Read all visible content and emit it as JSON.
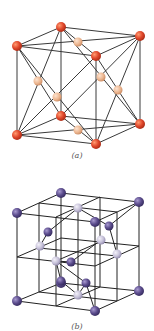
{
  "figures": [
    {
      "id": "a",
      "caption": "(a)",
      "description": "Face-centered cubic unit cell",
      "colors": {
        "corner_atom": "#d9432a",
        "face_atom": "#eab38e",
        "edge": "#333333"
      }
    },
    {
      "id": "b",
      "caption": "(b)",
      "description": "Diamond cubic unit cell",
      "colors": {
        "corner_atom": "#5a4b8a",
        "face_atom": "#c9c4d9",
        "interior_atom": "#5a4b8a",
        "edge": "#222222"
      }
    }
  ]
}
